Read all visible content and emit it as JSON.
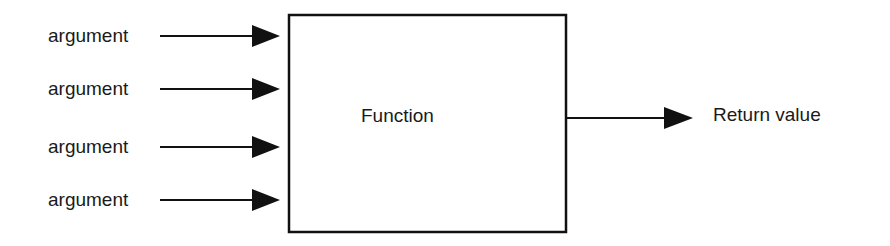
{
  "diagram": {
    "arguments": [
      {
        "label": "argument"
      },
      {
        "label": "argument"
      },
      {
        "label": "argument"
      },
      {
        "label": "argument"
      }
    ],
    "function_label": "Function",
    "output_label": "Return value",
    "colors": {
      "stroke": "#111111",
      "text": "#1a1a1a",
      "background": "#ffffff"
    }
  }
}
